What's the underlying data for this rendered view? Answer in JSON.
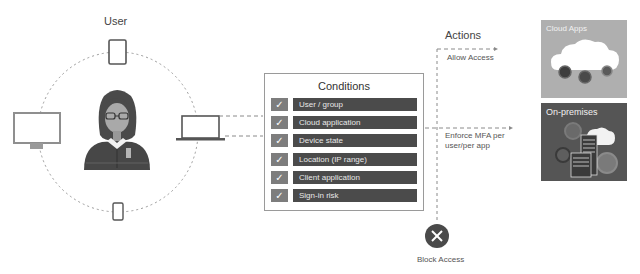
{
  "user_section": {
    "title": "User",
    "devices": [
      {
        "name": "tablet",
        "position": "top"
      },
      {
        "name": "desktop-monitor",
        "position": "left"
      },
      {
        "name": "laptop",
        "position": "right"
      },
      {
        "name": "smartphone",
        "position": "bottom"
      }
    ],
    "avatar": "person-with-glasses"
  },
  "conditions": {
    "title": "Conditions",
    "items": [
      {
        "label": "User / group",
        "checked": true
      },
      {
        "label": "Cloud application",
        "checked": true
      },
      {
        "label": "Device state",
        "checked": true
      },
      {
        "label": "Location (IP range)",
        "checked": true
      },
      {
        "label": "Client application",
        "checked": true
      },
      {
        "label": "Sign-in risk",
        "checked": true
      }
    ],
    "check_glyph": "✓"
  },
  "actions": {
    "title": "Actions",
    "allow": "Allow Access",
    "mfa_line1": "Enforce MFA per",
    "mfa_line2": "user/per app",
    "block": "Block Access",
    "block_glyph": "✕"
  },
  "destinations": {
    "cloud_apps": "Cloud Apps",
    "on_premises": "On-premises"
  },
  "colors": {
    "bar": "#4b4b4b",
    "check": "#7d7d7d",
    "cloud_tile": "#afafaf",
    "onprem_tile": "#555555",
    "dash": "#8a8a8a",
    "block_circle": "#4a4a4a"
  }
}
